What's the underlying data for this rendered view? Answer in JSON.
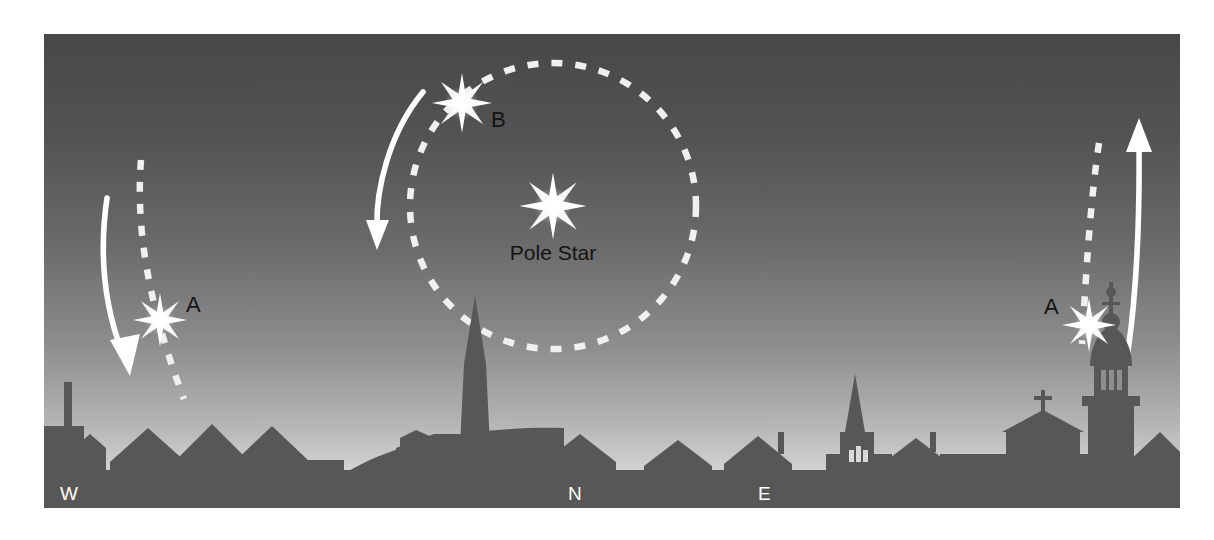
{
  "figure": {
    "frame": {
      "x": 44,
      "y": 34,
      "width": 1136,
      "height": 474
    },
    "sky": {
      "gradient_top_color": "#4a4a4a",
      "gradient_mid_color": "#707070",
      "gradient_bottom_color": "#d8d8d8"
    },
    "skyline": {
      "color": "#575757",
      "horizon_y": 436
    }
  },
  "labels": {
    "pole_star": "Pole Star",
    "star_b": "B",
    "star_a_west": "A",
    "star_a_east": "A",
    "compass_west": "W",
    "compass_north": "N",
    "compass_east": "E"
  },
  "colors": {
    "star_glow": "#ffffff",
    "trail_dashed": "#f2f2f2",
    "arrow": "#ffffff",
    "compass_text": "#ffffff",
    "star_label_text": "#141414",
    "pole_star_text": "#141414"
  },
  "stars": [
    {
      "name": "pole-star",
      "label": "Pole Star",
      "x": 509,
      "y": 172,
      "radius": 34
    },
    {
      "name": "star-b",
      "label": "B",
      "x": 418,
      "y": 69,
      "radius": 30
    },
    {
      "name": "star-a-west",
      "label": "A",
      "x": 116,
      "y": 286,
      "radius": 27
    },
    {
      "name": "star-a-east",
      "label": "A",
      "x": 1045,
      "y": 291,
      "radius": 27
    }
  ],
  "paths": {
    "circumpolar_circle": {
      "name": "circumpolar-orbit",
      "center_x": 509,
      "center_y": 172,
      "radius": 143,
      "style": "dashed"
    },
    "trail_west": {
      "name": "star-trail-west",
      "style": "dashed"
    },
    "trail_east": {
      "name": "star-trail-east",
      "style": "dashed"
    }
  },
  "arrows": [
    {
      "name": "motion-arrow-west",
      "direction": "down-left"
    },
    {
      "name": "motion-arrow-circumpolar",
      "direction": "down"
    },
    {
      "name": "motion-arrow-east",
      "direction": "up"
    }
  ]
}
